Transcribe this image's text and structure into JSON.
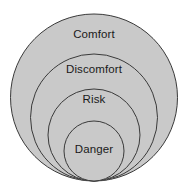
{
  "diagram": {
    "type": "nested-circles",
    "background_color": "#ffffff",
    "fill_color": "#c9c9c9",
    "stroke_color": "#3a3a3a",
    "stroke_width": 1,
    "text_color": "#1a1a1a",
    "canvas": {
      "width": 187,
      "height": 194
    },
    "zones": [
      {
        "label": "Comfort",
        "level": 1,
        "cx": 94,
        "cy": 97.5,
        "r": 83.5,
        "label_x": 94,
        "label_y": 35
      },
      {
        "label": "Discomfort",
        "level": 2,
        "cx": 94,
        "cy": 117.5,
        "r": 63.5,
        "label_x": 94,
        "label_y": 70
      },
      {
        "label": "Risk",
        "level": 3,
        "cx": 94,
        "cy": 135,
        "r": 46,
        "label_x": 94,
        "label_y": 100
      },
      {
        "label": "Danger",
        "level": 4,
        "cx": 94,
        "cy": 151,
        "r": 30,
        "label_x": 94,
        "label_y": 150
      }
    ]
  }
}
